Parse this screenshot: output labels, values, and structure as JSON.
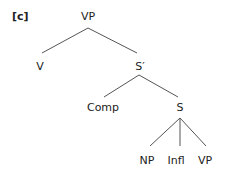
{
  "figure_label": "[c]",
  "tree": {
    "root": "VP",
    "nodes": {
      "vp_root": "VP",
      "v": "V",
      "s_bar": "S′",
      "comp": "Comp",
      "s": "S",
      "np": "NP",
      "infl": "Infl",
      "vp_leaf": "VP"
    },
    "edges": [
      [
        "VP",
        "V"
      ],
      [
        "VP",
        "S′"
      ],
      [
        "S′",
        "Comp"
      ],
      [
        "S′",
        "S"
      ],
      [
        "S",
        "NP"
      ],
      [
        "S",
        "Infl"
      ],
      [
        "S",
        "VP"
      ]
    ]
  }
}
